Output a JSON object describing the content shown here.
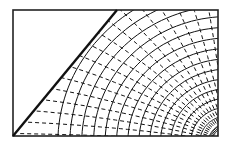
{
  "diagram": {
    "title": "",
    "width": 229,
    "height": 146,
    "colors": {
      "background": "#ffffff",
      "ink": "#111111",
      "frame": "#222222"
    },
    "frame": {
      "x": 13,
      "y": 10,
      "w": 205,
      "h": 126
    },
    "boundary_line": {
      "x1": 13,
      "y1": 136,
      "x2": 117,
      "y2": 10
    },
    "solid_curve_count": 16,
    "dashed_curve_count": 18,
    "labels": []
  }
}
